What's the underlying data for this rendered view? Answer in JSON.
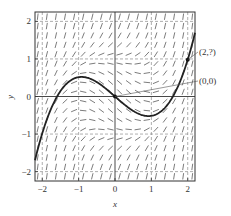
{
  "chart_data": {
    "type": "line",
    "title": "",
    "subtitle": "Slope field with solution curve through (0,0)",
    "xlabel": "x",
    "ylabel": "y",
    "xlim": [
      -2.2,
      2.2
    ],
    "ylim": [
      -2.25,
      2.25
    ],
    "x_ticks": [
      -2,
      -1,
      0,
      1,
      2
    ],
    "y_ticks": [
      -2,
      -1,
      0,
      1,
      2
    ],
    "x_tick_labels": [
      "−2",
      "−1",
      "0",
      "1",
      "2"
    ],
    "y_tick_labels": [
      "−2",
      "−1",
      "0",
      "1",
      "2"
    ],
    "grid": "dashed lines at integer ticks",
    "slope_field": {
      "description": "short line segments on a regular grid showing slopes dy/dx",
      "grid_spacing": 0.25,
      "approx_rule": "slope ~ x^2 + y^2 - 1 (flat near unit circle, steep outside)"
    },
    "series": [
      {
        "name": "solution curve",
        "description": "cubic-like curve through (0,0), local max ~0.5 near x=-0.85, local min ~-0.5 near x=0.85, passes (2,1)",
        "x": [
          -2.2,
          -2.0,
          -1.8,
          -1.55,
          -1.2,
          -0.85,
          -0.5,
          0,
          0.5,
          0.85,
          1.2,
          1.55,
          1.8,
          2.0,
          2.2
        ],
        "y": [
          -2.25,
          -1.05,
          -0.5,
          0.0,
          0.42,
          0.5,
          0.36,
          0.0,
          -0.36,
          -0.5,
          -0.42,
          0.0,
          0.5,
          1.0,
          2.25
        ]
      }
    ],
    "annotations": [
      {
        "label": "(2,?)",
        "point": [
          2,
          1
        ]
      },
      {
        "label": "(0,0)",
        "point": [
          0,
          0
        ]
      }
    ]
  }
}
